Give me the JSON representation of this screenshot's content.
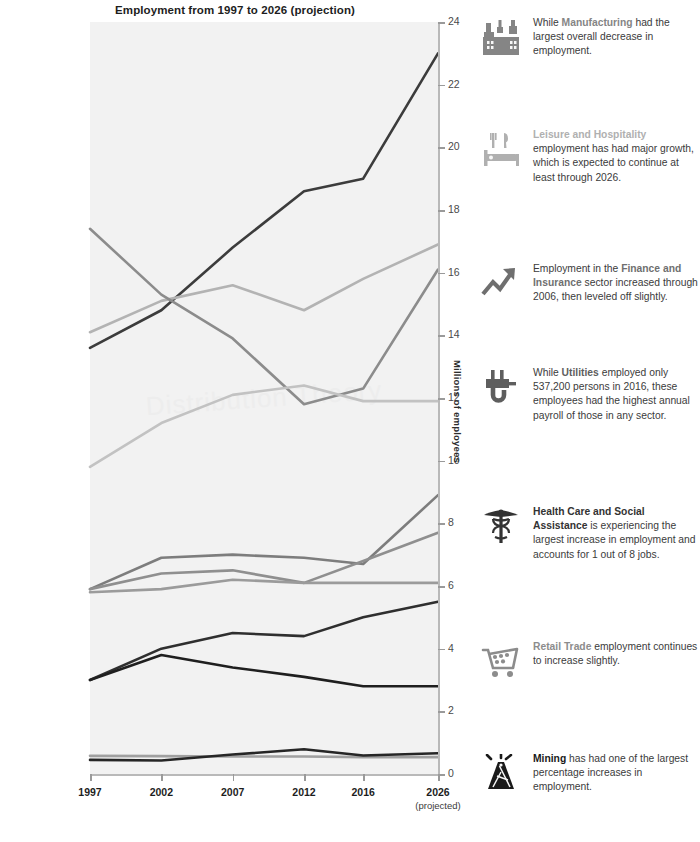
{
  "chart_data": {
    "type": "line",
    "title": "Employment from 1997 to 2026 (projection)",
    "xlabel": "",
    "ylabel": "Millions of employees",
    "ylim": [
      0,
      24
    ],
    "yticks": [
      0,
      2,
      4,
      6,
      8,
      10,
      12,
      14,
      16,
      18,
      20,
      22,
      24
    ],
    "grid": false,
    "legend": "inline-left-labels",
    "x": [
      "1997",
      "2002",
      "2007",
      "2012",
      "2016",
      "2026"
    ],
    "x_sub": [
      "",
      "",
      "",
      "",
      "",
      "(projected)"
    ],
    "series": [
      {
        "name": "Health care and\nsocial assistance",
        "label": "Health care and\nsocial assistance",
        "color": "#3c3c3c",
        "values": [
          13.6,
          14.8,
          16.8,
          18.6,
          19.0,
          23.0
        ]
      },
      {
        "name": "Retail trade",
        "label": "Retail trade",
        "color": "#b3b3b3",
        "values": [
          14.1,
          15.1,
          15.6,
          14.8,
          15.8,
          16.9
        ]
      },
      {
        "name": "Manufacturing",
        "label": "Manufacturing",
        "color": "#8c8c8c",
        "values": [
          17.4,
          15.3,
          13.9,
          11.8,
          12.3,
          16.1
        ]
      },
      {
        "name": "Leisure and\nhospitality",
        "label": "Leisure and\nhospitality",
        "color": "#c2c2c2",
        "values": [
          9.8,
          11.2,
          12.1,
          12.4,
          11.9,
          11.9
        ]
      },
      {
        "name": "Finance\nand insurance",
        "label": "Finance\nand insurance",
        "color": "#7d7d7d",
        "values": [
          5.9,
          6.9,
          7.0,
          6.9,
          6.7,
          8.9
        ]
      },
      {
        "name": "Wholesale trade",
        "label": "Wholesale trade",
        "color": "#8f8f8f",
        "values": [
          5.9,
          6.4,
          6.5,
          6.1,
          6.8,
          7.7
        ]
      },
      {
        "name": "Construction",
        "label": "Construction",
        "color": "#9b9b9b",
        "values": [
          5.8,
          5.9,
          6.2,
          6.1,
          6.1,
          6.1
        ]
      },
      {
        "name": "Information",
        "label": "Information",
        "color": "#2f2f2f",
        "values": [
          3.0,
          4.0,
          4.5,
          4.4,
          5.0,
          5.5
        ]
      },
      {
        "name": "Transportation\nand warehousing",
        "label": "Transportation\nand warehousing",
        "color": "#1f1f1f",
        "values": [
          3.0,
          3.8,
          3.4,
          3.1,
          2.8,
          2.8
        ]
      },
      {
        "name": "Utilities",
        "label": "Utilities",
        "color": "#a0a0a0",
        "values": [
          0.58,
          0.57,
          0.56,
          0.56,
          0.54,
          0.54
        ]
      },
      {
        "name": "Mining",
        "label": "Mining",
        "color": "#262626",
        "values": [
          0.45,
          0.43,
          0.62,
          0.79,
          0.59,
          0.66
        ]
      }
    ]
  },
  "annotations": [
    {
      "icon": "factory-icon",
      "icon_color": "#858585",
      "highlight": "Manufacturing",
      "text_before": "While ",
      "text_after": " had the largest overall decrease in employment."
    },
    {
      "icon": "hotel-bed-icon",
      "icon_color": "#b0b0b0",
      "highlight": "Leisure and Hospitality",
      "text_before": "",
      "text_after": " employment has had major growth, which is expected to continue at least through 2026."
    },
    {
      "icon": "trend-up-arrow-icon",
      "icon_color": "#6f6f6f",
      "highlight": "Finance and Insurance",
      "text_before": "Employment in the ",
      "text_after": " sector increased through 2006, then leveled off slightly."
    },
    {
      "icon": "power-plug-icon",
      "icon_color": "#5e5e5e",
      "highlight": "Utilities",
      "text_before": "While ",
      "text_after": " employed only 537,200 persons in 2016, these employees had the highest annual payroll of those in any sector."
    },
    {
      "icon": "caduceus-icon",
      "icon_color": "#333333",
      "highlight": "Health Care and Social Assistance",
      "text_before": "",
      "text_after": " is experiencing the largest increase in employment and accounts for 1 out of 8 jobs."
    },
    {
      "icon": "shopping-cart-icon",
      "icon_color": "#8c8c8c",
      "highlight": "Retail Trade",
      "text_before": "",
      "text_after": " employment continues to increase slightly."
    },
    {
      "icon": "oil-derrick-icon",
      "icon_color": "#1a1a1a",
      "highlight": "Mining",
      "text_before": "",
      "text_after": " has had one of the largest percentage increases in employment."
    }
  ],
  "watermark": "Distribution Theory"
}
